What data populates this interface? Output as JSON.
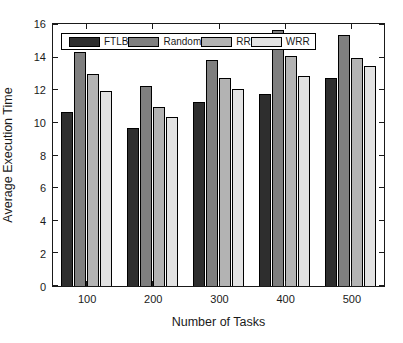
{
  "figure": {
    "background": "#ffffff"
  },
  "chart_data": {
    "type": "bar",
    "title": "",
    "xlabel": "Number of Tasks",
    "ylabel": "Average Execution Time",
    "categories": [
      "100",
      "200",
      "300",
      "400",
      "500"
    ],
    "series": [
      {
        "name": "FTLB",
        "color": "#2e2e2e",
        "values": [
          10.7,
          9.7,
          11.3,
          11.8,
          12.8
        ]
      },
      {
        "name": "Random",
        "color": "#7f7f7f",
        "values": [
          14.4,
          12.3,
          13.9,
          15.7,
          15.4
        ]
      },
      {
        "name": "RR",
        "color": "#b3b3b3",
        "values": [
          13.0,
          11.0,
          12.8,
          14.1,
          14.0
        ]
      },
      {
        "name": "WRR",
        "color": "#e2e2e2",
        "values": [
          12.0,
          10.4,
          12.1,
          12.9,
          13.5
        ]
      }
    ],
    "ylim": [
      0,
      16
    ],
    "yticks": [
      0,
      2,
      4,
      6,
      8,
      10,
      12,
      14,
      16
    ],
    "grid": false,
    "legend_position": "top-inside",
    "bar_edge_color": "#000000",
    "axis_color": "#1a1a1a"
  }
}
